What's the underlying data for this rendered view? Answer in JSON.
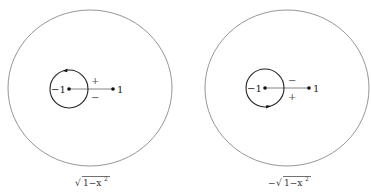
{
  "diagrams": [
    {
      "caption": "√1−x²",
      "caption_parts": {
        "prefix": "",
        "radical": "1−x",
        "exp": "2"
      },
      "point_left_label": "−1",
      "point_right_label": "1",
      "upper_sign": "+",
      "lower_sign": "−",
      "loop_arrow_position": "top"
    },
    {
      "caption": "−√1−x²",
      "caption_parts": {
        "prefix": "−",
        "radical": "1−x",
        "exp": "2"
      },
      "point_left_label": "−1",
      "point_right_label": "1",
      "upper_sign": "−",
      "lower_sign": "+",
      "loop_arrow_position": "bottom"
    }
  ],
  "colors": {
    "outer_circle": "#8a8a8a",
    "inner_loop": "#222222",
    "branch_cut": "#777777",
    "points": "#111111"
  }
}
